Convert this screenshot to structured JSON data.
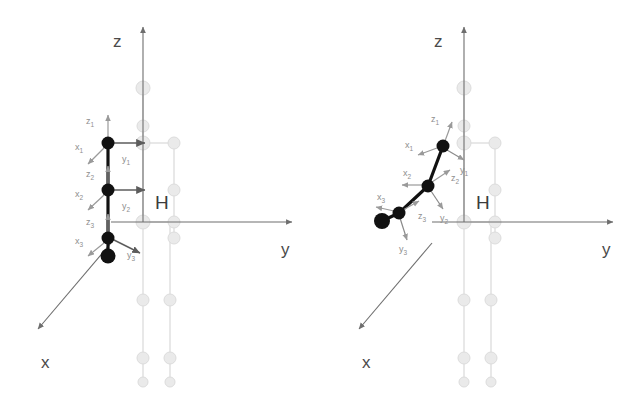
{
  "figure": {
    "type": "kinematic-diagram",
    "title": "",
    "background_color": "#ffffff",
    "panels": [
      {
        "id": "left",
        "name": "home-configuration",
        "caption": "",
        "world_axes": {
          "x": {
            "label": "x",
            "label_pos": [
              41,
              361
            ],
            "from": [
              111,
              243
            ],
            "to": [
              38,
              329
            ]
          },
          "y": {
            "label": "y",
            "label_pos": [
              281,
              248
            ],
            "from": [
              111,
              222
            ],
            "to": [
              292,
              222
            ]
          },
          "z": {
            "label": "z",
            "label_pos": [
              113,
              40
            ],
            "from": [
              143,
              222
            ],
            "to": [
              143,
              27
            ]
          }
        },
        "body_label": {
          "text": "H",
          "pos": [
            160,
            202
          ]
        },
        "arm": {
          "color": "#111111",
          "joints": [
            {
              "name": "shoulder-joint",
              "frame": 1,
              "cx": 108,
              "cy": 143,
              "r": 6.5
            },
            {
              "name": "elbow-joint",
              "frame": 2,
              "cx": 108,
              "cy": 190,
              "r": 6.5
            },
            {
              "name": "wrist-joint",
              "frame": 3,
              "cx": 108,
              "cy": 238,
              "r": 6.5
            },
            {
              "name": "end-effector",
              "frame": 4,
              "cx": 108,
              "cy": 256,
              "r": 7.5
            }
          ],
          "frames": [
            {
              "index": "1",
              "origin": [
                108,
                143
              ],
              "z": {
                "label": "z",
                "sub": "1",
                "tip": [
                  108,
                  115
                ],
                "label_pos": [
                  90,
                  121
                ]
              },
              "x": {
                "label": "x",
                "sub": "1",
                "tip": [
                  88,
                  164
                ],
                "label_pos": [
                  78,
                  147
                ]
              },
              "y": {
                "label": "y",
                "sub": "1",
                "tip": [
                  145,
                  143
                ],
                "label_pos": [
                  125,
                  159
                ]
              }
            },
            {
              "index": "2",
              "origin": [
                108,
                190
              ],
              "z": {
                "label": "z",
                "sub": "2",
                "tip": [
                  108,
                  166
                ],
                "label_pos": [
                  90,
                  174
                ]
              },
              "x": {
                "label": "x",
                "sub": "2",
                "tip": [
                  88,
                  210
                ],
                "label_pos": [
                  78,
                  194
                ]
              },
              "y": {
                "label": "y",
                "sub": "2",
                "tip": [
                  145,
                  190
                ],
                "label_pos": [
                  125,
                  206
                ]
              }
            },
            {
              "index": "3",
              "origin": [
                108,
                238
              ],
              "z": {
                "label": "z",
                "sub": "3",
                "tip": [
                  108,
                  214
                ],
                "label_pos": [
                  90,
                  222
                ]
              },
              "x": {
                "label": "x",
                "sub": "3",
                "tip": [
                  88,
                  256
                ],
                "label_pos": [
                  78,
                  241
                ]
              },
              "y": {
                "label": "y",
                "sub": "3",
                "tip": [
                  137,
                  254
                ],
                "label_pos": [
                  130,
                  252
                ]
              }
            }
          ]
        },
        "ghost_body": {
          "color": "#e3e3e3",
          "nodes": [
            {
              "name": "head-node",
              "cx": 143,
              "cy": 88,
              "r": 7
            },
            {
              "name": "neck-node",
              "cx": 143,
              "cy": 126,
              "r": 6
            },
            {
              "name": "left-shoulder-node",
              "cx": 143,
              "cy": 143,
              "r": 7
            },
            {
              "name": "right-shoulder-node",
              "cx": 174,
              "cy": 143,
              "r": 6
            },
            {
              "name": "right-elbow-node",
              "cx": 174,
              "cy": 190,
              "r": 6
            },
            {
              "name": "pelvis-left-node",
              "cx": 143,
              "cy": 222,
              "r": 7
            },
            {
              "name": "pelvis-right-node",
              "cx": 174,
              "cy": 222,
              "r": 6
            },
            {
              "name": "right-wrist-node",
              "cx": 174,
              "cy": 238,
              "r": 6
            },
            {
              "name": "left-knee-node",
              "cx": 143,
              "cy": 300,
              "r": 6
            },
            {
              "name": "right-knee-node",
              "cx": 170,
              "cy": 300,
              "r": 6
            },
            {
              "name": "left-ankle-node",
              "cx": 143,
              "cy": 358,
              "r": 6
            },
            {
              "name": "right-ankle-node",
              "cx": 170,
              "cy": 358,
              "r": 6
            },
            {
              "name": "left-foot-node",
              "cx": 143,
              "cy": 382,
              "r": 5
            },
            {
              "name": "right-foot-node",
              "cx": 170,
              "cy": 382,
              "r": 5
            }
          ],
          "links": [
            [
              143,
              88,
              143,
              222
            ],
            [
              143,
              143,
              174,
              143
            ],
            [
              174,
              143,
              174,
              238
            ],
            [
              143,
              222,
              174,
              222
            ],
            [
              143,
              222,
              143,
              382
            ],
            [
              170,
              222,
              170,
              382
            ]
          ]
        }
      },
      {
        "id": "right",
        "name": "bent-configuration",
        "caption": "",
        "world_axes": {
          "x": {
            "label": "x",
            "label_pos": [
              362,
              361
            ],
            "from": [
              432,
              243
            ],
            "to": [
              359,
              329
            ]
          },
          "y": {
            "label": "y",
            "label_pos": [
              602,
              248
            ],
            "from": [
              432,
              222
            ],
            "to": [
              613,
              222
            ]
          },
          "z": {
            "label": "z",
            "label_pos": [
              434,
              40
            ],
            "from": [
              464,
              222
            ],
            "to": [
              464,
              27
            ]
          }
        },
        "body_label": {
          "text": "H",
          "pos": [
            481,
            202
          ]
        },
        "arm": {
          "color": "#111111",
          "joints": [
            {
              "name": "shoulder-joint",
              "frame": 1,
              "cx": 443,
              "cy": 146,
              "r": 6.5
            },
            {
              "name": "elbow-joint",
              "frame": 2,
              "cx": 428,
              "cy": 186,
              "r": 6.5
            },
            {
              "name": "wrist-joint",
              "frame": 3,
              "cx": 399,
              "cy": 213,
              "r": 6.5
            },
            {
              "name": "end-effector",
              "frame": 4,
              "cx": 382,
              "cy": 221,
              "r": 8
            }
          ],
          "frames": [
            {
              "index": "1",
              "origin": [
                443,
                146
              ],
              "z": {
                "label": "z",
                "sub": "1",
                "tip": [
                  452,
                  122
                ],
                "label_pos": [
                  434,
                  119
                ]
              },
              "x": {
                "label": "x",
                "sub": "1",
                "tip": [
                  418,
                  155
                ],
                "label_pos": [
                  409,
                  145
                ]
              },
              "y": {
                "label": "y",
                "sub": "1",
                "tip": [
                  464,
                  159
                ],
                "label_pos": [
                  464,
                  167
                ]
              }
            },
            {
              "index": "2",
              "origin": [
                428,
                186
              ],
              "z": {
                "label": "z",
                "sub": "2",
                "tip": [
                  450,
                  172
                ],
                "label_pos": [
                  453,
                  176
                ]
              },
              "x": {
                "label": "x",
                "sub": "2",
                "tip": [
                  402,
                  185
                ],
                "label_pos": [
                  405,
                  174
                ]
              },
              "y": {
                "label": "y",
                "sub": "2",
                "tip": [
                  441,
                  208
                ],
                "label_pos": [
                  443,
                  215
                ]
              }
            },
            {
              "index": "3",
              "origin": [
                399,
                213
              ],
              "z": {
                "label": "z",
                "sub": "3",
                "tip": [
                  417,
                  204
                ],
                "label_pos": [
                  420,
                  214
                ]
              },
              "x": {
                "label": "x",
                "sub": "3",
                "tip": [
                  378,
                  209
                ],
                "label_pos": [
                  380,
                  198
                ]
              },
              "y": {
                "label": "y",
                "sub": "3",
                "tip": [
                  406,
                  239
                ],
                "label_pos": [
                  401,
                  246
                ]
              }
            }
          ]
        },
        "ghost_body": {
          "color": "#e3e3e3",
          "nodes": [
            {
              "name": "head-node",
              "cx": 464,
              "cy": 88,
              "r": 7
            },
            {
              "name": "neck-node",
              "cx": 464,
              "cy": 126,
              "r": 6
            },
            {
              "name": "left-shoulder-node",
              "cx": 464,
              "cy": 143,
              "r": 7
            },
            {
              "name": "right-shoulder-node",
              "cx": 495,
              "cy": 143,
              "r": 6
            },
            {
              "name": "right-elbow-node",
              "cx": 495,
              "cy": 190,
              "r": 6
            },
            {
              "name": "pelvis-left-node",
              "cx": 464,
              "cy": 222,
              "r": 7
            },
            {
              "name": "pelvis-right-node",
              "cx": 495,
              "cy": 222,
              "r": 6
            },
            {
              "name": "right-wrist-node",
              "cx": 495,
              "cy": 238,
              "r": 6
            },
            {
              "name": "left-knee-node",
              "cx": 464,
              "cy": 300,
              "r": 6
            },
            {
              "name": "right-knee-node",
              "cx": 491,
              "cy": 300,
              "r": 6
            },
            {
              "name": "left-ankle-node",
              "cx": 464,
              "cy": 358,
              "r": 6
            },
            {
              "name": "right-ankle-node",
              "cx": 491,
              "cy": 358,
              "r": 6
            },
            {
              "name": "left-foot-node",
              "cx": 464,
              "cy": 382,
              "r": 5
            },
            {
              "name": "right-foot-node",
              "cx": 491,
              "cy": 382,
              "r": 5
            }
          ],
          "links": [
            [
              464,
              88,
              464,
              222
            ],
            [
              464,
              143,
              495,
              143
            ],
            [
              495,
              143,
              495,
              238
            ],
            [
              464,
              222,
              495,
              222
            ],
            [
              464,
              222,
              464,
              382
            ],
            [
              491,
              222,
              491,
              382
            ]
          ]
        }
      }
    ],
    "colors": {
      "arm": "#111111",
      "ghost": "#e3e3e3",
      "axis": "#6e6e6e",
      "frame_arrow": "#9a9a9a",
      "axis_text": "#4a4a4a",
      "frame_text": "#8e8e8e"
    }
  }
}
